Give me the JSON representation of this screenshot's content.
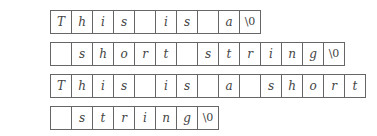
{
  "rows": [
    {
      "label": "a =",
      "top": 10,
      "cells": [
        "T",
        "h",
        "i",
        "s",
        "",
        "i",
        "s",
        "",
        "a",
        "\\0"
      ]
    },
    {
      "label": "b =",
      "top": 42,
      "cells": [
        "",
        "s",
        "h",
        "o",
        "r",
        "t",
        "",
        "s",
        "t",
        "r",
        "i",
        "n",
        "g",
        "\\0"
      ]
    },
    {
      "label": "a+b =",
      "top": 74,
      "cells": [
        "T",
        "h",
        "i",
        "s",
        "",
        "i",
        "s",
        "",
        "a",
        "",
        "s",
        "h",
        "o",
        "r",
        "t"
      ]
    },
    {
      "label": "",
      "top": 106,
      "cells": [
        "",
        "s",
        "t",
        "r",
        "i",
        "n",
        "g",
        "\\0"
      ]
    }
  ]
}
